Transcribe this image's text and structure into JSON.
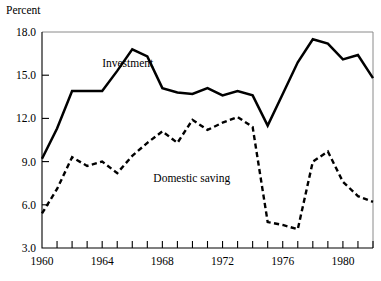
{
  "chart_data": {
    "type": "line",
    "title": "",
    "ylabel": "Percent",
    "xlabel": "",
    "ylim": [
      3.0,
      18.0
    ],
    "xlim": [
      1960,
      1982
    ],
    "grid": false,
    "legend": "inline-annotations",
    "ytick_labels": [
      "18.0",
      "15.0",
      "12.0",
      "9.0",
      "6.0",
      "3.0"
    ],
    "ytick_values": [
      18.0,
      15.0,
      12.0,
      9.0,
      6.0,
      3.0
    ],
    "xtick_labels": [
      "1960",
      "1964",
      "1968",
      "1972",
      "1976",
      "1980"
    ],
    "xtick_values": [
      1960,
      1964,
      1968,
      1972,
      1976,
      1980
    ],
    "xtick_all": [
      1960,
      1961,
      1962,
      1963,
      1964,
      1965,
      1966,
      1967,
      1968,
      1969,
      1970,
      1971,
      1972,
      1973,
      1974,
      1975,
      1976,
      1977,
      1978,
      1979,
      1980,
      1981,
      1982
    ],
    "x": [
      1960,
      1961,
      1962,
      1963,
      1964,
      1965,
      1966,
      1967,
      1968,
      1969,
      1970,
      1971,
      1972,
      1973,
      1974,
      1975,
      1976,
      1977,
      1978,
      1979,
      1980,
      1981,
      1982
    ],
    "series": [
      {
        "name": "Investment",
        "style": "solid",
        "values": [
          9.2,
          11.3,
          13.9,
          13.9,
          13.9,
          15.3,
          16.8,
          16.3,
          14.1,
          13.8,
          13.7,
          14.1,
          13.6,
          13.9,
          13.6,
          11.5,
          13.7,
          15.9,
          17.5,
          17.2,
          16.1,
          16.4,
          14.8
        ]
      },
      {
        "name": "Domestic saving",
        "style": "dashed",
        "values": [
          5.4,
          7.1,
          9.3,
          8.7,
          9.0,
          8.2,
          9.4,
          10.3,
          11.1,
          10.3,
          11.9,
          11.2,
          11.7,
          12.1,
          11.4,
          4.8,
          4.6,
          4.3,
          9.0,
          9.7,
          7.6,
          6.6,
          6.2
        ]
      }
    ],
    "annotations": [
      {
        "text": "Investment",
        "x": 1964.0,
        "y": 15.6
      },
      {
        "text": "Domestic saving",
        "x": 1967.4,
        "y": 7.6
      }
    ]
  },
  "axis": {
    "y_axis_title": "Percent"
  }
}
